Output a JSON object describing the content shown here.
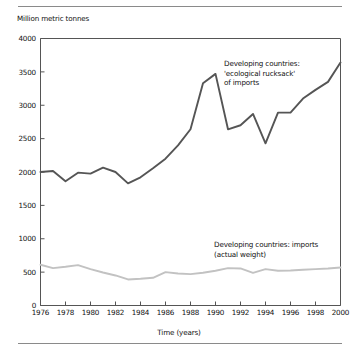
{
  "figure": {
    "axis_label_y": "Million metric tonnes",
    "axis_label_x": "Time (years)"
  },
  "annotations": {
    "rucksack": "Developing countries:\n'ecological rucksack'\nof imports",
    "actual_weight": "Developing countries: imports\n(actual weight)"
  },
  "chart_data": {
    "type": "line",
    "title": "",
    "subtitle": "",
    "xlabel": "Time (years)",
    "ylabel": "Million metric tonnes",
    "xlim": [
      1976,
      2000
    ],
    "ylim": [
      0,
      4000
    ],
    "ytick_labels": [
      "0",
      "500",
      "1000",
      "1500",
      "2000",
      "2500",
      "3000",
      "3500",
      "4000"
    ],
    "yticks": [
      0,
      500,
      1000,
      1500,
      2000,
      2500,
      3000,
      3500,
      4000
    ],
    "xtick_labels": [
      "1976",
      "1978",
      "1980",
      "1982",
      "1984",
      "1986",
      "1988",
      "1990",
      "1992",
      "1994",
      "1996",
      "1998",
      "2000"
    ],
    "xticks": [
      1976,
      1978,
      1980,
      1982,
      1984,
      1986,
      1988,
      1990,
      1992,
      1994,
      1996,
      1998,
      2000
    ],
    "grid": false,
    "legend_position": "inline-annotations",
    "x": [
      1976,
      1977,
      1978,
      1979,
      1980,
      1981,
      1982,
      1983,
      1984,
      1985,
      1986,
      1987,
      1988,
      1989,
      1990,
      1991,
      1992,
      1993,
      1994,
      1995,
      1996,
      1997,
      1998,
      1999,
      2000
    ],
    "series": [
      {
        "name": "Developing countries: 'ecological rucksack' of imports",
        "color": "#555555",
        "width": 1.9,
        "values": [
          2000,
          2015,
          1860,
          1990,
          1975,
          2065,
          2000,
          1830,
          1920,
          2055,
          2200,
          2400,
          2640,
          3330,
          3470,
          2640,
          2700,
          2870,
          2430,
          2890,
          2890,
          3100,
          3230,
          3350,
          3640
        ]
      },
      {
        "name": "Developing countries: imports (actual weight)",
        "color": "#c2c2c2",
        "width": 1.9,
        "values": [
          610,
          560,
          580,
          605,
          545,
          495,
          450,
          390,
          400,
          415,
          500,
          480,
          470,
          490,
          520,
          560,
          555,
          490,
          545,
          520,
          525,
          535,
          545,
          555,
          570
        ]
      }
    ]
  }
}
